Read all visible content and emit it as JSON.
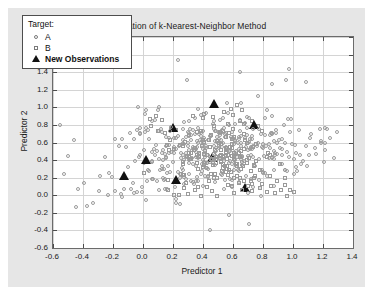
{
  "chart_data": {
    "type": "scatter",
    "title": "Illustration of k-Nearest-Neighbor Method",
    "xlabel": "Predictor 1",
    "ylabel": "Predictor 2",
    "xlim": [
      -0.6,
      1.4
    ],
    "ylim": [
      -0.6,
      1.8
    ],
    "xticks": [
      "-0.6",
      "-0.4",
      "-0.2",
      "0.0",
      "0.2",
      "0.4",
      "0.6",
      "0.8",
      "1.0",
      "1.2",
      "1.4"
    ],
    "xtick_values": [
      -0.6,
      -0.4,
      -0.2,
      0.0,
      0.2,
      0.4,
      0.6,
      0.8,
      1.0,
      1.2,
      1.4
    ],
    "yticks": [
      "1.8",
      "1.6",
      "1.4",
      "1.2",
      "1.0",
      "0.8",
      "0.6",
      "0.4",
      "0.2",
      "0.0",
      "-0.2",
      "-0.4",
      "-0.6"
    ],
    "ytick_values": [
      1.8,
      1.6,
      1.4,
      1.2,
      1.0,
      0.8,
      0.6,
      0.4,
      0.2,
      0.0,
      -0.2,
      -0.4,
      -0.6
    ],
    "grid": true,
    "legend_position": "upper-left",
    "legend_title": "Target:",
    "colors": {
      "marker_outline": "#9a9a9a",
      "new_observation": "#111111",
      "figure_background": "#e6e6e6",
      "axes_background": "#ffffff",
      "gridline": "#d4d4d4"
    },
    "series": [
      {
        "name": "A",
        "marker": "circle-open",
        "points": [
          [
            -0.55,
            0.78
          ],
          [
            -0.52,
            0.23
          ],
          [
            -0.5,
            0.43
          ],
          [
            -0.46,
            0.64
          ],
          [
            -0.43,
            0.07
          ],
          [
            -0.4,
            0.15
          ],
          [
            -0.38,
            -0.12
          ],
          [
            -0.34,
            -0.08
          ],
          [
            -0.3,
            0.05
          ],
          [
            -0.28,
            0.23
          ],
          [
            -0.26,
            0.43
          ],
          [
            -0.24,
            0.02
          ],
          [
            -0.22,
            0.26
          ],
          [
            -0.21,
            0.22
          ],
          [
            -0.18,
            0.05
          ],
          [
            -0.16,
            0.57
          ],
          [
            -0.15,
            0.02
          ],
          [
            -0.13,
            0.0
          ],
          [
            -0.11,
            0.55
          ],
          [
            -0.1,
            0.3
          ],
          [
            -0.09,
            0.72
          ],
          [
            -0.07,
            0.08
          ],
          [
            -0.06,
            0.04
          ],
          [
            -0.05,
            0.38
          ],
          [
            -0.04,
            0.74
          ],
          [
            -0.03,
            0.45
          ],
          [
            -0.02,
            0.69
          ],
          [
            -0.01,
            0.02
          ],
          [
            0.0,
            0.36
          ],
          [
            0.01,
            0.78
          ],
          [
            0.02,
            0.97
          ],
          [
            0.03,
            0.64
          ],
          [
            0.04,
            0.28
          ],
          [
            0.05,
            0.4
          ],
          [
            0.06,
            0.84
          ],
          [
            0.07,
            0.2
          ],
          [
            0.08,
            0.56
          ],
          [
            0.09,
            0.15
          ],
          [
            0.1,
            0.98
          ],
          [
            0.11,
            0.73
          ],
          [
            0.12,
            0.49
          ],
          [
            0.13,
            0.33
          ],
          [
            0.14,
            0.08
          ],
          [
            0.15,
            0.66
          ],
          [
            0.16,
            0.44
          ],
          [
            0.17,
            0.26
          ],
          [
            0.18,
            0.58
          ],
          [
            0.19,
            0.77
          ],
          [
            0.2,
            0.37
          ],
          [
            0.21,
            0.11
          ],
          [
            0.22,
            0.52
          ],
          [
            0.23,
            0.65
          ],
          [
            0.24,
            -0.1
          ],
          [
            0.25,
            0.3
          ],
          [
            0.26,
            0.47
          ],
          [
            0.27,
            0.84
          ],
          [
            0.28,
            0.19
          ],
          [
            0.29,
            0.61
          ],
          [
            0.3,
            0.41
          ],
          [
            0.31,
            0.25
          ],
          [
            0.32,
            0.7
          ],
          [
            0.33,
            0.53
          ],
          [
            0.34,
            0.35
          ],
          [
            0.35,
            0.88
          ],
          [
            0.36,
            0.16
          ],
          [
            0.37,
            0.6
          ],
          [
            0.38,
            0.45
          ],
          [
            0.39,
            0.28
          ],
          [
            0.4,
            0.73
          ],
          [
            0.41,
            0.92
          ],
          [
            0.42,
            0.38
          ],
          [
            0.43,
            0.55
          ],
          [
            0.44,
            0.22
          ],
          [
            0.45,
            0.68
          ],
          [
            0.46,
            0.8
          ],
          [
            0.47,
            0.33
          ],
          [
            0.48,
            0.5
          ],
          [
            0.49,
            0.13
          ],
          [
            0.5,
            0.64
          ],
          [
            0.51,
            0.86
          ],
          [
            0.52,
            0.42
          ],
          [
            0.53,
            0.57
          ],
          [
            0.54,
            0.27
          ],
          [
            0.55,
            0.71
          ],
          [
            0.56,
            0.95
          ],
          [
            0.57,
            0.36
          ],
          [
            0.58,
            0.52
          ],
          [
            0.59,
            0.18
          ],
          [
            0.6,
            0.66
          ],
          [
            0.61,
            0.81
          ],
          [
            0.62,
            0.44
          ],
          [
            0.63,
            0.59
          ],
          [
            0.64,
            0.3
          ],
          [
            0.65,
            0.74
          ],
          [
            0.66,
            1.05
          ],
          [
            0.67,
            0.39
          ],
          [
            0.68,
            0.54
          ],
          [
            0.69,
            0.21
          ],
          [
            0.7,
            0.62
          ],
          [
            0.71,
            0.89
          ],
          [
            0.72,
            0.47
          ],
          [
            0.73,
            0.67
          ],
          [
            0.74,
            0.32
          ],
          [
            0.75,
            0.76
          ],
          [
            0.76,
            1.13
          ],
          [
            0.78,
            0.41
          ],
          [
            0.8,
            0.58
          ],
          [
            0.82,
            0.24
          ],
          [
            0.84,
            0.7
          ],
          [
            0.86,
            1.25
          ],
          [
            0.88,
            0.49
          ],
          [
            0.9,
            0.63
          ],
          [
            0.92,
            0.35
          ],
          [
            0.94,
            0.79
          ],
          [
            0.96,
            0.87
          ],
          [
            0.98,
            0.45
          ],
          [
            1.0,
            0.6
          ],
          [
            1.02,
            0.28
          ],
          [
            1.04,
            0.73
          ],
          [
            1.06,
            0.4
          ],
          [
            1.08,
            0.55
          ],
          [
            1.1,
            0.33
          ],
          [
            1.12,
            0.66
          ],
          [
            1.15,
            0.47
          ],
          [
            1.18,
            0.58
          ],
          [
            1.2,
            0.39
          ],
          [
            1.22,
            0.52
          ],
          [
            1.25,
            0.64
          ],
          [
            1.28,
            0.44
          ],
          [
            1.3,
            0.72
          ],
          [
            0.3,
            1.3
          ],
          [
            0.24,
            1.54
          ],
          [
            0.64,
            1.4
          ],
          [
            0.96,
            1.3
          ],
          [
            1.08,
            1.27
          ],
          [
            0.44,
            -0.4
          ],
          [
            0.7,
            -0.32
          ],
          [
            0.58,
            -0.22
          ],
          [
            -0.45,
            -0.13
          ],
          [
            0.22,
            -0.1
          ]
        ]
      },
      {
        "name": "B",
        "marker": "square-open",
        "points": [
          [
            0.05,
            0.8
          ],
          [
            0.1,
            0.74
          ],
          [
            0.14,
            0.69
          ],
          [
            0.18,
            0.64
          ],
          [
            0.22,
            0.75
          ],
          [
            0.26,
            0.58
          ],
          [
            0.3,
            0.67
          ],
          [
            0.33,
            0.48
          ],
          [
            0.36,
            0.72
          ],
          [
            0.39,
            0.55
          ],
          [
            0.41,
            0.62
          ],
          [
            0.43,
            0.44
          ],
          [
            0.45,
            0.7
          ],
          [
            0.47,
            0.52
          ],
          [
            0.49,
            0.38
          ],
          [
            0.5,
            0.6
          ],
          [
            0.52,
            0.46
          ],
          [
            0.54,
            0.34
          ],
          [
            0.55,
            0.66
          ],
          [
            0.57,
            0.42
          ],
          [
            0.58,
            0.28
          ],
          [
            0.6,
            0.54
          ],
          [
            0.62,
            0.36
          ],
          [
            0.63,
            0.22
          ],
          [
            0.65,
            0.48
          ],
          [
            0.66,
            0.3
          ],
          [
            0.68,
            0.18
          ],
          [
            0.69,
            0.4
          ],
          [
            0.71,
            0.26
          ],
          [
            0.72,
            0.12
          ],
          [
            0.74,
            0.34
          ],
          [
            0.75,
            0.2
          ],
          [
            0.77,
            0.08
          ],
          [
            0.78,
            0.28
          ],
          [
            0.8,
            0.14
          ],
          [
            0.82,
            0.04
          ],
          [
            0.84,
            0.22
          ],
          [
            0.86,
            0.1
          ],
          [
            0.88,
            0.02
          ],
          [
            0.9,
            0.16
          ],
          [
            0.92,
            0.06
          ],
          [
            0.94,
            0.12
          ],
          [
            0.96,
            0.0
          ],
          [
            0.98,
            0.08
          ],
          [
            1.0,
            0.03
          ],
          [
            0.35,
            0.06
          ],
          [
            0.38,
            0.0
          ],
          [
            0.42,
            0.1
          ],
          [
            0.46,
            0.04
          ],
          [
            0.5,
            0.0
          ],
          [
            0.24,
            0.02
          ],
          [
            0.28,
            0.08
          ],
          [
            0.31,
            0.0
          ],
          [
            0.16,
            0.05
          ],
          [
            0.2,
            0.0
          ],
          [
            0.44,
            0.65
          ],
          [
            0.48,
            0.78
          ],
          [
            0.52,
            0.72
          ],
          [
            0.56,
            0.82
          ],
          [
            0.6,
            0.76
          ],
          [
            0.64,
            0.84
          ],
          [
            0.68,
            0.79
          ],
          [
            0.72,
            0.86
          ],
          [
            0.76,
            0.8
          ],
          [
            0.8,
            0.74
          ],
          [
            0.12,
            0.84
          ],
          [
            0.08,
            0.9
          ],
          [
            0.04,
            0.86
          ],
          [
            0.46,
            0.9
          ],
          [
            0.54,
            0.94
          ],
          [
            0.58,
            0.99
          ],
          [
            0.62,
            1.02
          ],
          [
            0.66,
            0.98
          ],
          [
            0.4,
            0.86
          ],
          [
            0.34,
            0.9
          ]
        ]
      },
      {
        "name": "New Observations",
        "marker": "triangle-filled",
        "points": [
          [
            -0.13,
            0.22
          ],
          [
            0.02,
            0.4
          ],
          [
            0.2,
            0.76
          ],
          [
            0.22,
            0.17
          ],
          [
            0.47,
            1.04
          ],
          [
            0.46,
            0.42
          ],
          [
            0.68,
            0.08
          ],
          [
            0.74,
            0.8
          ]
        ]
      }
    ]
  },
  "legend": {
    "title": "Target:",
    "rows": [
      {
        "label": "A",
        "marker": "circle-open-icon",
        "bold": false
      },
      {
        "label": "B",
        "marker": "square-open-icon",
        "bold": false
      },
      {
        "label": "New Observations",
        "marker": "triangle-filled-icon",
        "bold": true
      }
    ]
  }
}
